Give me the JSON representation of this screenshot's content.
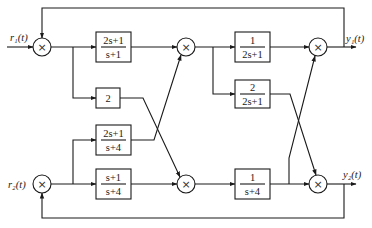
{
  "diagram": {
    "type": "block-diagram",
    "inputs": [
      {
        "id": "r1",
        "label": "r₁(t)"
      },
      {
        "id": "r2",
        "label": "r₂(t)"
      }
    ],
    "outputs": [
      {
        "id": "y1",
        "label": "y₁(t)"
      },
      {
        "id": "y2",
        "label": "y₂(t)"
      }
    ],
    "multipliers": [
      {
        "id": "m1",
        "symbol": "×"
      },
      {
        "id": "m2",
        "symbol": "×"
      },
      {
        "id": "m3",
        "symbol": "×"
      },
      {
        "id": "m4",
        "symbol": "×"
      },
      {
        "id": "m5",
        "symbol": "×"
      },
      {
        "id": "m6",
        "symbol": "×"
      }
    ],
    "blocks": [
      {
        "id": "b1",
        "num": "2s+1",
        "den": "s+1"
      },
      {
        "id": "b2",
        "num": "2",
        "den": ""
      },
      {
        "id": "b3",
        "num": "2s+1",
        "den": "s+4"
      },
      {
        "id": "b4",
        "num": "s+1",
        "den": "s+4"
      },
      {
        "id": "b5",
        "num": "1",
        "den": "2s+1"
      },
      {
        "id": "b6",
        "num": "2",
        "den": "2s+1"
      },
      {
        "id": "b7",
        "num": "1",
        "den": "s+4"
      }
    ],
    "connections": [
      "r1 -> m1",
      "y1 feedback -> m1",
      "m1 -> b1",
      "m1 -> b2",
      "r2 -> m2",
      "y2 feedback -> m2",
      "m2 -> b3",
      "m2 -> b4",
      "b1 -> m3",
      "b3 -> m3",
      "b2 -> m4",
      "b4 -> m4",
      "m3 -> b5",
      "m3 -> b6",
      "m4 -> b7",
      "b5 -> m5",
      "b7 -> m5",
      "b6 -> m6",
      "b7 -> m6",
      "m5 -> y1",
      "m6 -> y2"
    ]
  }
}
